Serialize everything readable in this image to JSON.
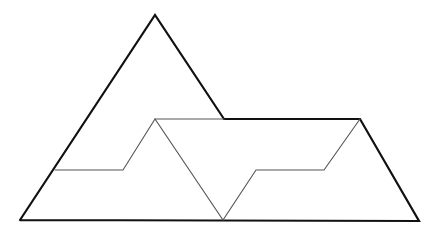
{
  "diagram": {
    "type": "geometric-dissection",
    "canvas": {
      "width": 441,
      "height": 234,
      "background": "#ffffff"
    },
    "stroke_color": "#111111",
    "inner_stroke_color": "#555555",
    "outline": {
      "points": [
        [
          20,
          220
        ],
        [
          155,
          15
        ],
        [
          224,
          119
        ],
        [
          360,
          119
        ],
        [
          419,
          221
        ],
        [
          20,
          220
        ]
      ],
      "stroke_width": 2.2
    },
    "inner_lines": [
      {
        "name": "zigzag-cut",
        "points": [
          [
            55,
            170
          ],
          [
            123,
            170
          ],
          [
            155,
            119
          ],
          [
            223,
            220
          ],
          [
            256,
            170
          ],
          [
            324,
            170
          ],
          [
            360,
            119
          ]
        ],
        "stroke_width": 1.1
      },
      {
        "name": "top-cut",
        "points": [
          [
            155,
            119
          ],
          [
            224,
            119
          ]
        ],
        "stroke_width": 1.1
      }
    ]
  }
}
